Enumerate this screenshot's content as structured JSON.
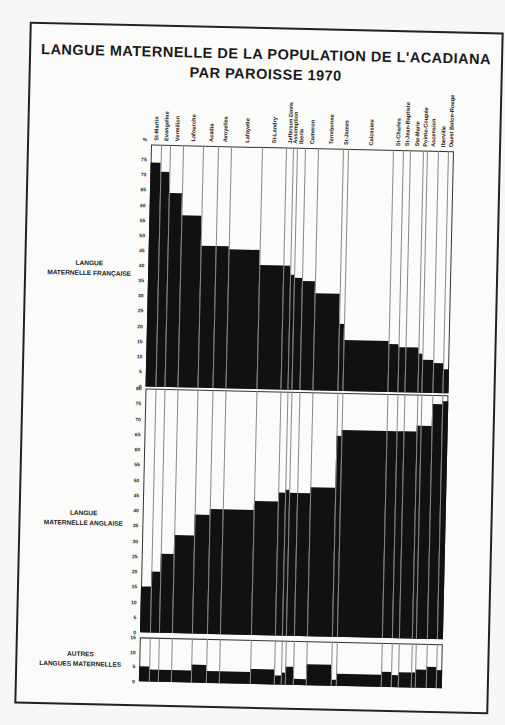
{
  "title_line1": "LANGUE MATERNELLE DE LA POPULATION DE L'ACADIANA",
  "title_line2": "PAR PAROISSE 1970",
  "axis_unit": "%",
  "panel_labels": {
    "french": [
      "LANGUE",
      "MATERNELLE FRANÇAISE"
    ],
    "english": [
      "LANGUE",
      "MATERNELLE ANGLAISE"
    ],
    "other": [
      "AUTRES",
      "LANGUES MATERNELLES"
    ]
  },
  "chart_data": [
    {
      "type": "bar",
      "title": "Langue maternelle française",
      "ylabel": "%",
      "ylim": [
        0,
        80
      ],
      "yticks": [
        0,
        5,
        10,
        15,
        20,
        25,
        30,
        35,
        40,
        45,
        50,
        55,
        60,
        65,
        70,
        75
      ],
      "categories": [
        "St-Martin",
        "Evangeline",
        "Vermilion",
        "Lafourche",
        "Acadia",
        "Avoyelles",
        "Lafayette",
        "St-Landry",
        "Jefferson Davis",
        "Assomption",
        "Iberia",
        "Cameron",
        "Terrebonne",
        "St-James",
        "Calcasieu",
        "St-Charles",
        "St-Jean-Baptiste",
        "Ste-Marie",
        "Pointe-Coupée",
        "Ascension",
        "Iberville",
        "Ouest Baton-Rouge"
      ],
      "values": [
        74,
        71,
        64,
        57,
        47,
        47,
        46,
        41,
        41,
        38,
        37,
        36,
        32,
        22,
        17,
        16,
        15,
        15,
        13,
        11,
        10,
        8
      ]
    },
    {
      "type": "bar",
      "title": "Langue maternelle anglaise",
      "ylabel": "%",
      "ylim": [
        0,
        80
      ],
      "yticks": [
        0,
        5,
        10,
        15,
        20,
        25,
        30,
        35,
        40,
        45,
        50,
        55,
        60,
        65,
        70,
        75,
        80
      ],
      "categories": [
        "St-Martin",
        "Evangeline",
        "Vermilion",
        "Lafourche",
        "Acadia",
        "Avoyelles",
        "Lafayette",
        "St-Landry",
        "Jefferson Davis",
        "Assomption",
        "Iberia",
        "Cameron",
        "Terrebonne",
        "St-James",
        "Calcasieu",
        "St-Charles",
        "St-Jean-Baptiste",
        "Ste-Marie",
        "Pointe-Coupée",
        "Ascension",
        "Iberville",
        "Ouest Baton-Rouge"
      ],
      "values": [
        15,
        20,
        26,
        32,
        39,
        41,
        41,
        44,
        47,
        48,
        47,
        47,
        49,
        66,
        68,
        68,
        68,
        68,
        70,
        70,
        77,
        78
      ]
    },
    {
      "type": "bar",
      "title": "Autres langues maternelles",
      "ylabel": "%",
      "ylim": [
        0,
        15
      ],
      "yticks": [
        0,
        5,
        10,
        15
      ],
      "categories": [
        "St-Martin",
        "Evangeline",
        "Vermilion",
        "Lafourche",
        "Acadia",
        "Avoyelles",
        "Lafayette",
        "St-Landry",
        "Jefferson Davis",
        "Assomption",
        "Iberia",
        "Cameron",
        "Terrebonne",
        "St-James",
        "Calcasieu",
        "St-Charles",
        "St-Jean-Baptiste",
        "Ste-Marie",
        "Pointe-Coupée",
        "Ascension",
        "Iberville",
        "Ouest Baton-Rouge"
      ],
      "values": [
        5,
        4,
        4,
        4,
        6,
        4,
        4,
        5,
        3,
        4,
        6,
        2,
        7,
        2,
        4,
        5,
        4,
        5,
        5,
        6,
        7,
        6
      ]
    }
  ],
  "column_widths": [
    10,
    9,
    13,
    20,
    15,
    13,
    31,
    24,
    7,
    4,
    8,
    13,
    25,
    5,
    45,
    10,
    7,
    13,
    4,
    11,
    10,
    6
  ]
}
